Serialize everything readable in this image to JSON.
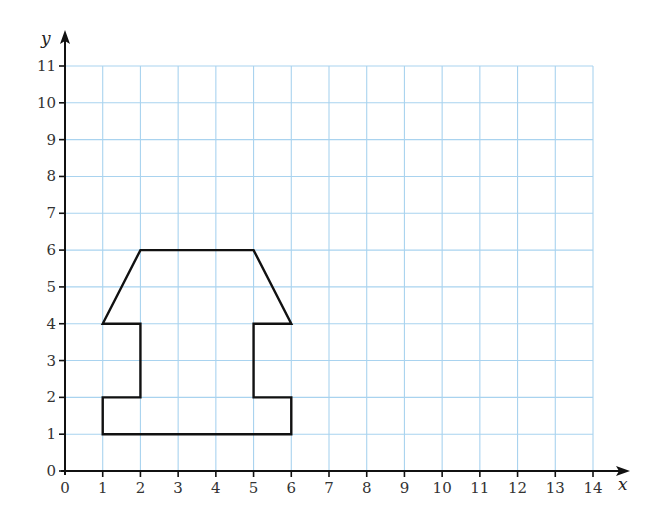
{
  "chart_data": {
    "type": "line",
    "title": "",
    "xlabel": "x",
    "ylabel": "y",
    "xlim": [
      0,
      14
    ],
    "ylim": [
      0,
      11
    ],
    "grid": true,
    "x_ticks": [
      "0",
      "1",
      "2",
      "3",
      "4",
      "5",
      "6",
      "7",
      "8",
      "9",
      "10",
      "11",
      "12",
      "13",
      "14"
    ],
    "y_ticks": [
      "0",
      "1",
      "2",
      "3",
      "4",
      "5",
      "6",
      "7",
      "8",
      "9",
      "10",
      "11"
    ],
    "series": [
      {
        "name": "shape",
        "closed": true,
        "points": [
          [
            1,
            1
          ],
          [
            1,
            2
          ],
          [
            2,
            2
          ],
          [
            2,
            4
          ],
          [
            1,
            4
          ],
          [
            2,
            6
          ],
          [
            5,
            6
          ],
          [
            6,
            4
          ],
          [
            5,
            4
          ],
          [
            5,
            2
          ],
          [
            6,
            2
          ],
          [
            6,
            1
          ]
        ]
      }
    ]
  },
  "colors": {
    "grid": "#a9d3ef",
    "axis": "#111111",
    "shape": "#111111"
  }
}
